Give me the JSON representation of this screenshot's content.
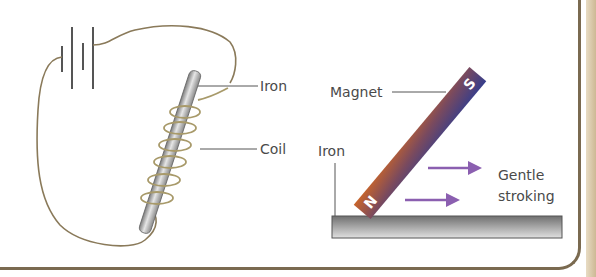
{
  "figure": {
    "left_panel": {
      "title": "Electromagnet method",
      "labels": {
        "iron": "Iron",
        "coil": "Coil"
      },
      "components": [
        "battery-cell",
        "wire",
        "iron-rod",
        "coil"
      ]
    },
    "right_panel": {
      "title": "Stroking method",
      "labels": {
        "magnet": "Magnet",
        "iron": "Iron",
        "motion_line1": "Gentle",
        "motion_line2": "stroking"
      },
      "poles": {
        "north": "N",
        "south": "S"
      },
      "components": [
        "bar-magnet",
        "iron-bar",
        "arrow",
        "arrow"
      ]
    },
    "colors": {
      "wire": "#8a7a5a",
      "iron": "#a9a9a9",
      "magnet_north": "#c2622b",
      "magnet_south": "#3b3f8f",
      "arrow": "#8b5fb0",
      "label_text": "#4a4a4a",
      "frame": "#7a6a50"
    }
  }
}
